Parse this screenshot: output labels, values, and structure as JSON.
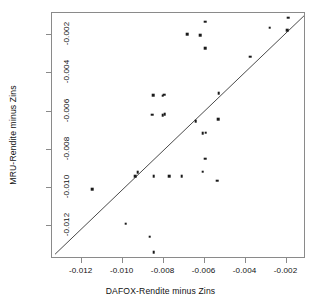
{
  "chart_data": {
    "type": "scatter",
    "title": "",
    "xlabel": "DAFOX-Rendite minus Zins",
    "ylabel": "MRU-Rendite minus Zins",
    "xlim": [
      -0.01345,
      -0.00105
    ],
    "ylim": [
      -0.0137,
      -0.00085
    ],
    "xticks": [
      -0.012,
      -0.01,
      -0.008,
      -0.006,
      -0.004,
      -0.002
    ],
    "xticklabels": [
      "-0.012",
      "-0.010",
      "-0.008",
      "-0.006",
      "-0.004",
      "-0.002"
    ],
    "yticks": [
      -0.012,
      -0.01,
      -0.008,
      -0.006,
      -0.004,
      -0.002
    ],
    "yticklabels": [
      "-0.012",
      "-0.010",
      "-0.008",
      "-0.006",
      "-0.004",
      "-0.002"
    ],
    "grid": false,
    "legend": null,
    "point_color": "#1a1a1a",
    "point_symbol": "filled-square",
    "frame_color": "#8a8a8a",
    "reference_line": {
      "description": "identity line y = x",
      "slope": 1,
      "intercept": 0,
      "color": "#4a4a4a",
      "x_start": -0.0133,
      "y_start": -0.01345,
      "x_end": -0.00115,
      "y_end": -0.001
    },
    "x": [
      -0.00686,
      -0.00622,
      -0.00598,
      -0.00596,
      -0.00376,
      -0.00283,
      -0.00192,
      -0.00196,
      -0.00852,
      -0.00798,
      -0.00805,
      -0.00855,
      -0.00795,
      -0.00805,
      -0.00532,
      -0.00643,
      -0.0061,
      -0.00595,
      -0.00533,
      -0.00926,
      -0.00938,
      -0.00849,
      -0.00712,
      -0.00772,
      -0.00598,
      -0.0061,
      -0.00538,
      -0.0115,
      -0.00986,
      -0.00868,
      -0.00848
    ],
    "y": [
      -0.00196,
      -0.002,
      -0.00268,
      -0.0013,
      -0.00313,
      -0.00161,
      -0.00109,
      -0.00176,
      -0.00514,
      -0.00512,
      -0.00516,
      -0.00617,
      -0.00613,
      -0.00619,
      -0.00504,
      -0.00651,
      -0.00712,
      -0.0071,
      -0.00641,
      -0.00918,
      -0.00937,
      -0.00937,
      -0.00937,
      -0.00937,
      -0.00846,
      -0.00913,
      -0.00962,
      -0.01005,
      -0.01185,
      -0.01254,
      -0.01335
    ]
  },
  "axis": {
    "x_title": "DAFOX-Rendite minus Zins",
    "y_title": "MRU-Rendite minus Zins"
  }
}
